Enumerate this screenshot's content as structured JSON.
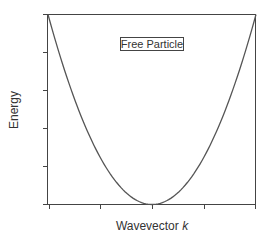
{
  "chart_data": {
    "type": "line",
    "title": "",
    "annotation": "Free Particle",
    "xlabel": "Wavevector",
    "xlabel_italic": "k",
    "ylabel": "Energy",
    "x_ticks": 5,
    "y_ticks": 6,
    "tick_labels": false,
    "grid": false,
    "legend": "none",
    "series": [
      {
        "name": "E(k) = k^2",
        "x": [
          -1,
          -0.75,
          -0.5,
          -0.25,
          0,
          0.25,
          0.5,
          0.75,
          1
        ],
        "values": [
          1,
          0.5625,
          0.25,
          0.0625,
          0,
          0.0625,
          0.25,
          0.5625,
          1
        ]
      }
    ],
    "xlim": [
      -1,
      1
    ],
    "ylim": [
      0,
      1
    ],
    "colors": {
      "curve": "#555555",
      "axes": "#444444",
      "text": "#333333"
    }
  }
}
